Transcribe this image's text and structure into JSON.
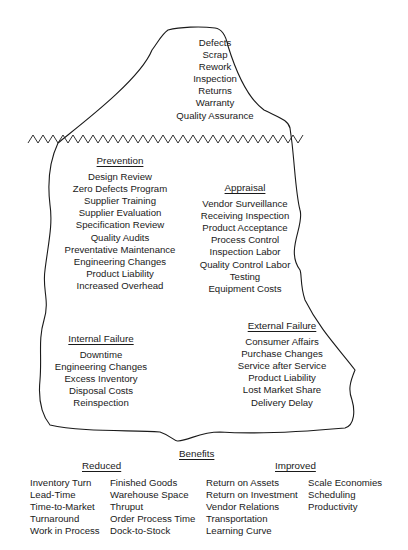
{
  "tip": {
    "items": [
      "Defects",
      "Scrap",
      "Rework",
      "Inspection",
      "Returns",
      "Warranty",
      "Quality Assurance"
    ]
  },
  "prevention": {
    "heading": "Prevention",
    "items": [
      "Design Review",
      "Zero Defects Program",
      "Supplier Training",
      "Supplier Evaluation",
      "Specification Review",
      "Quality Audits",
      "Preventative Maintenance",
      "Engineering Changes",
      "Product Liability",
      "Increased Overhead"
    ]
  },
  "appraisal": {
    "heading": "Appraisal",
    "items": [
      "Vendor Surveillance",
      "Receiving Inspection",
      "Product Acceptance",
      "Process Control",
      "Inspection Labor",
      "Quality Control Labor",
      "Testing",
      "Equipment Costs"
    ]
  },
  "internal_failure": {
    "heading": "Internal Failure",
    "items": [
      "Downtime",
      "Engineering Changes",
      "Excess Inventory",
      "Disposal Costs",
      "Reinspection"
    ]
  },
  "external_failure": {
    "heading": "External Failure",
    "items": [
      "Consumer Affairs",
      "Purchase Changes",
      "Service after Service",
      "Product Liability",
      "Lost Market Share",
      "Delivery Delay"
    ]
  },
  "benefits": {
    "heading": "Benefits",
    "reduced": {
      "heading": "Reduced",
      "col1": [
        "Inventory Turn",
        "Lead-Time",
        "Time-to-Market",
        "Turnaround",
        "Work in Process"
      ],
      "col2": [
        "Finished Goods",
        "Warehouse Space",
        "Thruput",
        "Order Process Time",
        "Dock-to-Stock"
      ]
    },
    "improved": {
      "heading": "Improved",
      "col1": [
        "Return on Assets",
        "Return on Investment",
        "Vendor Relations",
        "Transportation",
        "Learning Curve"
      ],
      "col2": [
        "Scale Economies",
        "Scheduling",
        "Productivity"
      ]
    }
  },
  "colors": {
    "line": "#1a1a1a",
    "background": "#ffffff"
  }
}
